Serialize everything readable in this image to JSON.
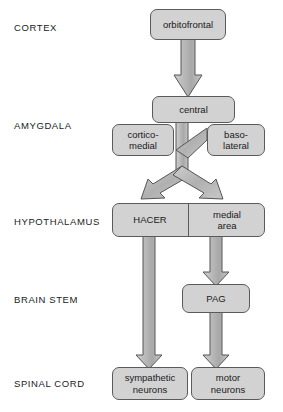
{
  "diagram": {
    "colors": {
      "box_fill": "#d2d2d2",
      "box_stroke": "#5a5a5a",
      "arrow_fill": "#b9b9b9",
      "arrow_stroke": "#555555",
      "background": "#ffffff",
      "text": "#1a1a1a"
    },
    "levels": [
      {
        "id": "cortex",
        "label": "CORTEX",
        "x": 14,
        "y": 22
      },
      {
        "id": "amygdala",
        "label": "AMYGDALA",
        "x": 14,
        "y": 120
      },
      {
        "id": "hypothalamus",
        "label": "HYPOTHALAMUS",
        "x": 14,
        "y": 216
      },
      {
        "id": "brain-stem",
        "label": "BRAIN STEM",
        "x": 14,
        "y": 294
      },
      {
        "id": "spinal-cord",
        "label": "SPINAL CORD",
        "x": 14,
        "y": 378
      }
    ],
    "nodes": [
      {
        "id": "orbitofrontal",
        "label": "orbitofrontal",
        "x": 150,
        "y": 9,
        "w": 76,
        "h": 31
      },
      {
        "id": "central",
        "label": "central",
        "x": 152,
        "y": 96,
        "w": 83,
        "h": 27
      },
      {
        "id": "cortico-medial",
        "label": "cortico-\nmedial",
        "x": 112,
        "y": 124,
        "w": 62,
        "h": 32
      },
      {
        "id": "baso-lateral",
        "label": "baso-\nlateral",
        "x": 207,
        "y": 124,
        "w": 58,
        "h": 32
      },
      {
        "id": "hacer-medial-area",
        "label": "",
        "x": 112,
        "y": 203,
        "w": 153,
        "h": 34
      },
      {
        "id": "hacer",
        "label": "HACER",
        "x": 112,
        "y": 203,
        "w": 76,
        "h": 34
      },
      {
        "id": "medial-area",
        "label": "medial\narea",
        "x": 189,
        "y": 203,
        "w": 76,
        "h": 34
      },
      {
        "id": "pag",
        "label": "PAG",
        "x": 182,
        "y": 284,
        "w": 68,
        "h": 29
      },
      {
        "id": "sympathetic-neurons",
        "label": "sympathetic\nneurons",
        "x": 112,
        "y": 367,
        "w": 76,
        "h": 33
      },
      {
        "id": "motor-neurons",
        "label": "motor\nneurons",
        "x": 191,
        "y": 367,
        "w": 74,
        "h": 33
      }
    ],
    "arrows": [
      {
        "id": "orbitofrontal-to-central",
        "from": "orbitofrontal",
        "to": "central"
      },
      {
        "id": "central-to-junction",
        "from": "central",
        "to": "junction"
      },
      {
        "id": "baso-lateral-to-junction",
        "from": "baso-lateral",
        "to": "junction"
      },
      {
        "id": "junction-to-hacer",
        "from": "junction",
        "to": "hacer"
      },
      {
        "id": "junction-to-medial-area",
        "from": "junction",
        "to": "medial-area"
      },
      {
        "id": "hacer-to-sympathetic-neurons",
        "from": "hacer",
        "to": "sympathetic-neurons"
      },
      {
        "id": "medial-area-to-pag",
        "from": "medial-area",
        "to": "pag"
      },
      {
        "id": "pag-to-motor-neurons",
        "from": "pag",
        "to": "motor-neurons"
      }
    ]
  }
}
